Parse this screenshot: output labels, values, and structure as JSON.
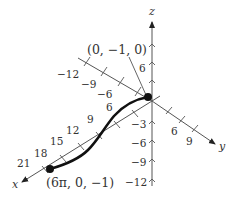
{
  "figure": {
    "type": "3d-space-curve",
    "axes": {
      "x": {
        "label": "x",
        "ticks": [
          "6",
          "9",
          "12",
          "15",
          "18",
          "21"
        ],
        "neg_ticks": [
          "-6",
          "-9",
          "-12"
        ]
      },
      "y": {
        "label": "y",
        "ticks": [
          "6",
          "9"
        ]
      },
      "z": {
        "label": "z",
        "ticks_pos": [
          "6"
        ],
        "ticks_neg": [
          "-3",
          "-6",
          "-9",
          "-12"
        ]
      }
    },
    "points": [
      {
        "label": "(0, −1, 0)"
      },
      {
        "label": "(6π, 0, −1)"
      }
    ],
    "colors": {
      "curve": "#111111",
      "axis": "#555555",
      "text": "#333333"
    }
  },
  "labels": {
    "x_axis": "x",
    "y_axis": "y",
    "z_axis": "z",
    "start_point": "(0, −1, 0)",
    "end_point": "(6π, 0, −1)",
    "tick_neg12": "−12",
    "tick_neg9": "−9",
    "tick_neg6": "−6",
    "x6": "6",
    "x9": "9",
    "x12": "12",
    "x15": "15",
    "x18": "18",
    "x21": "21",
    "y6": "6",
    "y9": "9",
    "z6": "6",
    "zm3": "−3",
    "zm6": "−6",
    "zm9": "−9",
    "zm12": "−12"
  }
}
